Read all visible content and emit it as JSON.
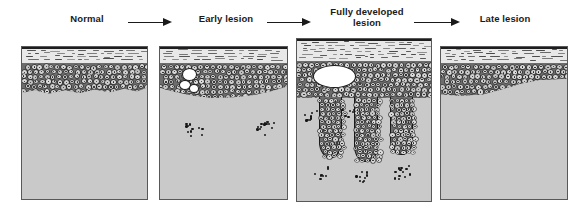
{
  "figure": {
    "type": "histology-schematic-sequence",
    "colors": {
      "dermis": "#c9c9c9",
      "stratum_corneum": "#e8e8e8",
      "epidermis_matrix": "#6d6d6d",
      "cell_cytoplasm": "#dedede",
      "outline": "#1b1b1b",
      "vacuole": "#ffffff",
      "panel_border": "#58585a",
      "label_text": "#1a1a1a",
      "background": "#ffffff"
    }
  },
  "stages": [
    {
      "id": "normal",
      "label": "Normal",
      "label_x": 57,
      "label_y": 14,
      "label_w": 60,
      "panel": {
        "x": 21,
        "y": 46,
        "w": 127,
        "h": 154
      },
      "corneum": {
        "top": 0,
        "height": 16
      },
      "epidermis": {
        "top": 16,
        "height": 34
      },
      "vacuoles": [],
      "ridges": [],
      "infiltrate_clusters": []
    },
    {
      "id": "early-lesion",
      "label": "Early lesion",
      "label_x": 191,
      "label_y": 14,
      "label_w": 70,
      "panel": {
        "x": 159,
        "y": 46,
        "w": 129,
        "h": 154
      },
      "corneum": {
        "top": 0,
        "height": 16
      },
      "epidermis": {
        "top": 16,
        "height": 38
      },
      "vacuoles": [
        {
          "x": 22,
          "y": 21,
          "w": 13,
          "h": 11
        },
        {
          "x": 19,
          "y": 33,
          "w": 10,
          "h": 8
        },
        {
          "x": 29,
          "y": 37,
          "w": 8,
          "h": 7
        }
      ],
      "ridges": [],
      "infiltrate_clusters": [
        {
          "cx": 33,
          "cy": 82,
          "n": 11,
          "spread": 17
        },
        {
          "cx": 105,
          "cy": 80,
          "n": 14,
          "spread": 18
        }
      ]
    },
    {
      "id": "fully-developed-lesion",
      "label": "Fully developed\nlesion",
      "label_x": 325,
      "label_y": 7,
      "label_w": 84,
      "panel": {
        "x": 296,
        "y": 38,
        "w": 136,
        "h": 164
      },
      "corneum": {
        "top": 0,
        "height": 22
      },
      "epidermis": {
        "top": 22,
        "height": 40
      },
      "vacuoles": [
        {
          "x": 16,
          "y": 26,
          "w": 41,
          "h": 21
        }
      ],
      "ridges": [
        {
          "x": 22,
          "y": 58,
          "w": 21,
          "h": 60
        },
        {
          "x": 57,
          "y": 58,
          "w": 22,
          "h": 64
        },
        {
          "x": 93,
          "y": 58,
          "w": 21,
          "h": 57
        }
      ],
      "infiltrate_clusters": [
        {
          "cx": 12,
          "cy": 76,
          "n": 8,
          "spread": 14
        },
        {
          "cx": 50,
          "cy": 72,
          "n": 6,
          "spread": 13
        },
        {
          "cx": 22,
          "cy": 133,
          "n": 9,
          "spread": 16
        },
        {
          "cx": 66,
          "cy": 136,
          "n": 9,
          "spread": 16
        },
        {
          "cx": 104,
          "cy": 132,
          "n": 12,
          "spread": 17
        }
      ]
    },
    {
      "id": "late-lesion",
      "label": "Late lesion",
      "label_x": 470,
      "label_y": 14,
      "label_w": 70,
      "panel": {
        "x": 440,
        "y": 46,
        "w": 128,
        "h": 154
      },
      "corneum": {
        "top": 0,
        "height": 16
      },
      "epidermis": {
        "top": 16,
        "height": 34
      },
      "vacuoles": [],
      "ridges": [],
      "infiltrate_clusters": []
    }
  ],
  "arrows": [
    {
      "id": "arrow-normal-to-early",
      "x": 128,
      "y": 18,
      "w": 44
    },
    {
      "id": "arrow-early-to-fully",
      "x": 267,
      "y": 18,
      "w": 44
    },
    {
      "id": "arrow-fully-to-late",
      "x": 414,
      "y": 18,
      "w": 46
    }
  ]
}
